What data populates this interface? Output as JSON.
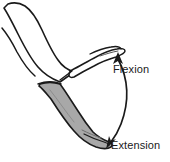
{
  "diagram": {
    "background_color": "#ffffff",
    "outline_color": "#1a1a1a",
    "shaded_fill_color": "#a8a8a8",
    "unshaded_fill_color": "#ffffff",
    "label_text_color": "#1a1a1a",
    "annotations": [
      {
        "id": "flexion",
        "label": "Flexion",
        "arrow": "arrow-up",
        "position": "upper-right",
        "describes": "foot-flexed-unshaded"
      },
      {
        "id": "extension",
        "label": "Extension",
        "arrow": "arrow-down-left",
        "position": "lower-right",
        "describes": "foot-extended-shaded"
      }
    ],
    "parts": [
      {
        "id": "thigh",
        "name": "upper-leg",
        "fill": "unshaded"
      },
      {
        "id": "foot-flexed",
        "name": "foot-in-flexion",
        "fill": "unshaded"
      },
      {
        "id": "lower-leg-shaded",
        "name": "lower-leg-and-foot-in-extension",
        "fill": "shaded"
      }
    ],
    "range_arc": {
      "name": "double-headed-range-of-motion-arc",
      "heads": 2,
      "from": "extension",
      "to": "flexion"
    }
  }
}
